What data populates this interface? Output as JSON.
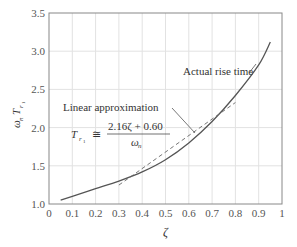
{
  "chart_data": {
    "type": "line",
    "title": "",
    "xlabel": "ζ",
    "ylabel": "ω_n T_r1",
    "xlim": [
      0,
      1
    ],
    "ylim": [
      1.0,
      3.5
    ],
    "grid": true,
    "x_ticks": [
      "0",
      "0.1",
      "0.2",
      "0.3",
      "0.4",
      "0.5",
      "0.6",
      "0.7",
      "0.8",
      "0.9",
      "1"
    ],
    "y_ticks": [
      "1.0",
      "1.5",
      "2.0",
      "2.5",
      "3.0",
      "3.5"
    ],
    "series": [
      {
        "name": "Actual rise time",
        "style": "solid",
        "x": [
          0.05,
          0.1,
          0.2,
          0.3,
          0.4,
          0.5,
          0.6,
          0.7,
          0.8,
          0.9,
          0.95
        ],
        "y": [
          1.05,
          1.1,
          1.2,
          1.3,
          1.42,
          1.58,
          1.8,
          2.08,
          2.42,
          2.82,
          3.12
        ]
      },
      {
        "name": "Linear approximation",
        "style": "dashed",
        "x": [
          0.3,
          0.8
        ],
        "y": [
          1.248,
          2.328
        ]
      }
    ],
    "annotations": [
      {
        "text": "Actual rise time"
      },
      {
        "text": "Linear approximation"
      },
      {
        "text": "T_r1 ≅ (2.16ζ + 0.60) / ω_n"
      }
    ]
  },
  "labels": {
    "actual": "Actual rise time",
    "linear": "Linear approximation",
    "formula_lhs": "T",
    "formula_sub": "r",
    "formula_subsub": "1",
    "formula_approx": "≅",
    "formula_num": "2.16ζ + 0.60",
    "formula_den": "ω",
    "formula_den_sub": "n",
    "xlabel": "ζ",
    "ylabel_omega": "ω",
    "ylabel_n": "n",
    "ylabel_T": "T",
    "ylabel_r": "r",
    "ylabel_1": "1"
  }
}
